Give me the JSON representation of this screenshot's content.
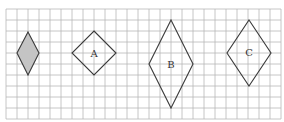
{
  "diagram": {
    "grid": {
      "x0": 6,
      "y0": 9,
      "cell": 11,
      "cols": 25,
      "rows": 10,
      "color": "#b8b8b8"
    },
    "shapes": [
      {
        "id": "shaded",
        "label": "",
        "shaded": true,
        "points": [
          [
            28,
            32
          ],
          [
            39,
            53
          ],
          [
            28,
            75
          ],
          [
            17,
            53
          ]
        ]
      },
      {
        "id": "A",
        "label": "A",
        "shaded": false,
        "points": [
          [
            94,
            31
          ],
          [
            116,
            53
          ],
          [
            94,
            75
          ],
          [
            72,
            53
          ]
        ],
        "label_pos": [
          94,
          54
        ]
      },
      {
        "id": "B",
        "label": "B",
        "shaded": false,
        "points": [
          [
            171,
            20
          ],
          [
            193,
            64
          ],
          [
            171,
            108
          ],
          [
            149,
            64
          ]
        ],
        "label_pos": [
          171,
          65
        ]
      },
      {
        "id": "C",
        "label": "C",
        "shaded": false,
        "points": [
          [
            249,
            20
          ],
          [
            271,
            53
          ],
          [
            249,
            86
          ],
          [
            227,
            53
          ]
        ],
        "label_pos": [
          249,
          53
        ]
      }
    ]
  }
}
